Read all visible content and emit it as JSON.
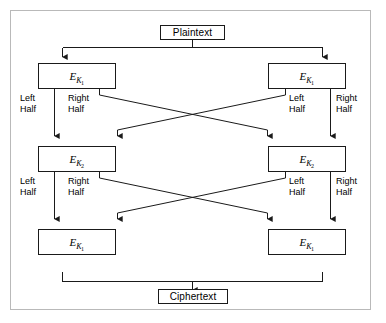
{
  "figure": {
    "frame_color": "#b9b9b9",
    "line_color": "#1a1a1a",
    "background": "#ffffff"
  },
  "terminals": {
    "input": {
      "label": "Plaintext"
    },
    "output": {
      "label": "Ciphertext"
    }
  },
  "rounds": [
    {
      "row": 1,
      "left": {
        "cipher": "E",
        "key_sub": "K",
        "key_index": "1"
      },
      "right": {
        "cipher": "E",
        "key_sub": "K",
        "key_index": "1"
      }
    },
    {
      "row": 2,
      "left": {
        "cipher": "E",
        "key_sub": "K",
        "key_index": "2"
      },
      "right": {
        "cipher": "E",
        "key_sub": "K",
        "key_index": "2"
      }
    },
    {
      "row": 3,
      "left": {
        "cipher": "E",
        "key_sub": "K",
        "key_index": "1"
      },
      "right": {
        "cipher": "E",
        "key_sub": "K",
        "key_index": "1"
      }
    }
  ],
  "half_labels": {
    "left_half_line1": "Left",
    "left_half_line2": "Half",
    "right_half_line1": "Right",
    "right_half_line2": "Half"
  },
  "stage_labels": [
    {
      "stage": 1,
      "outer_left": "Left Half",
      "inner_left": "Right Half",
      "inner_right": "Left Half",
      "outer_right": "Right Half"
    },
    {
      "stage": 2,
      "outer_left": "Left Half",
      "inner_left": "Right Half",
      "inner_right": "Left Half",
      "outer_right": "Right Half"
    }
  ]
}
